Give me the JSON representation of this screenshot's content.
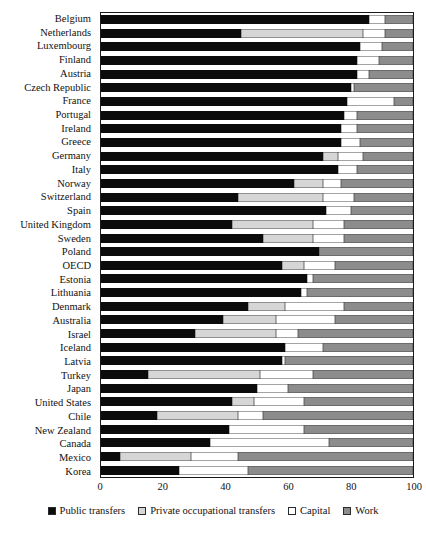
{
  "chart_data": {
    "type": "bar",
    "orientation": "horizontal",
    "stacked": true,
    "title": "",
    "xlabel": "",
    "ylabel": "",
    "xlim": [
      0,
      100
    ],
    "xticks": [
      0,
      20,
      40,
      60,
      80,
      100
    ],
    "grid": false,
    "legend_position": "bottom",
    "series": [
      {
        "name": "Public transfers",
        "color": "#0b0b0b",
        "key": "public"
      },
      {
        "name": "Private occupational transfers",
        "color": "#d6d6d6",
        "key": "private"
      },
      {
        "name": "Capital",
        "color": "#ffffff",
        "key": "capital"
      },
      {
        "name": "Work",
        "color": "#8c8c8c",
        "key": "work"
      }
    ],
    "categories": [
      "Belgium",
      "Netherlands",
      "Luxembourg",
      "Finland",
      "Austria",
      "Czech Republic",
      "France",
      "Portugal",
      "Ireland",
      "Greece",
      "Germany",
      "Italy",
      "Norway",
      "Switzerland",
      "Spain",
      "United Kingdom",
      "Sweden",
      "Poland",
      "OECD",
      "Estonia",
      "Lithuania",
      "Denmark",
      "Australia",
      "Israel",
      "Iceland",
      "Latvia",
      "Turkey",
      "Japan",
      "United States",
      "Chile",
      "New Zealand",
      "Canada",
      "Mexico",
      "Korea"
    ],
    "values": {
      "public": [
        86,
        45,
        83,
        82,
        82,
        80,
        79,
        78,
        77,
        77,
        71,
        76,
        62,
        44,
        72,
        42,
        52,
        70,
        58,
        66,
        64,
        47,
        39,
        30,
        59,
        58,
        15,
        50,
        42,
        18,
        41,
        35,
        6,
        25
      ],
      "private": [
        0,
        39,
        0,
        0,
        0,
        0,
        0,
        0,
        0,
        0,
        5,
        0,
        9,
        27,
        0,
        26,
        16,
        0,
        7,
        0,
        0,
        12,
        17,
        26,
        0,
        0,
        36,
        0,
        7,
        26,
        0,
        0,
        23,
        0
      ],
      "capital": [
        5,
        7,
        7,
        7,
        4,
        1,
        15,
        4,
        5,
        6,
        8,
        6,
        6,
        10,
        8,
        10,
        10,
        0,
        10,
        2,
        2,
        19,
        19,
        7,
        12,
        1,
        17,
        10,
        16,
        8,
        24,
        38,
        15,
        22
      ],
      "work": [
        9,
        9,
        10,
        11,
        14,
        19,
        6,
        18,
        18,
        17,
        16,
        18,
        23,
        19,
        20,
        22,
        22,
        30,
        25,
        32,
        34,
        22,
        25,
        37,
        29,
        41,
        32,
        40,
        35,
        48,
        35,
        27,
        56,
        53
      ]
    }
  }
}
